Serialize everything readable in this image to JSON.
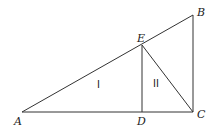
{
  "diagram": {
    "points": {
      "A": {
        "label": "A",
        "x": 22,
        "y": 112
      },
      "D": {
        "label": "D",
        "x": 142,
        "y": 112
      },
      "C": {
        "label": "C",
        "x": 193,
        "y": 112
      },
      "B": {
        "label": "B",
        "x": 193,
        "y": 15
      },
      "E": {
        "label": "E",
        "x": 142,
        "y": 45
      }
    },
    "segments": [
      "AC",
      "CB",
      "BA",
      "ED",
      "EC"
    ],
    "regions": [
      {
        "label": "I"
      },
      {
        "label": "II"
      }
    ],
    "colors": {
      "line": "#333333",
      "text": "#222222",
      "background": "#ffffff"
    }
  }
}
